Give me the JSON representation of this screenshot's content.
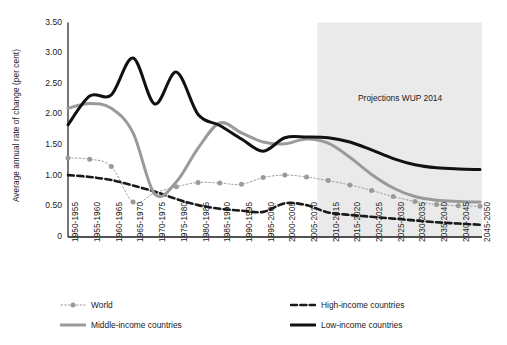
{
  "chart_data": {
    "type": "line",
    "title": "",
    "subtitle": "",
    "xlabel": "",
    "ylabel": "Average annual rate of change (per cent)",
    "ylim": [
      0,
      3.5
    ],
    "ytick_labels": [
      "3.50",
      "3.00",
      "2.50",
      "2.00",
      "1.50",
      "1.00",
      "0.50",
      "0"
    ],
    "ytick_values": [
      3.5,
      3.0,
      2.5,
      2.0,
      1.5,
      1.0,
      0.5,
      0
    ],
    "grid": false,
    "legend_position": "bottom",
    "categories": [
      "1950-1955",
      "1955-1960",
      "1960-1965",
      "1965-1970",
      "1970-1975",
      "1975-1980",
      "1980-1985",
      "1985-1990",
      "1990-1995",
      "1995-2000",
      "2000-2005",
      "2005-2010",
      "2010-2015",
      "2015-2020",
      "2020-2025",
      "2025-2030",
      "2030-2035",
      "2035-2040",
      "2040-2045",
      "2045-2050"
    ],
    "annotations": [
      {
        "text": "Projections WUP 2014",
        "type": "shaded-region-label",
        "region_start_category": "2010-2015",
        "region_end_category": "2045-2050",
        "region_color": "#eaeaea"
      }
    ],
    "series": [
      {
        "name": "World",
        "color": "#9a9a9a",
        "style": "dotted-with-markers",
        "marker": "circle",
        "values": [
          1.29,
          1.27,
          1.15,
          0.57,
          0.72,
          0.82,
          0.89,
          0.88,
          0.86,
          0.97,
          1.01,
          0.98,
          0.92,
          0.85,
          0.76,
          0.66,
          0.58,
          0.53,
          0.51,
          0.5
        ]
      },
      {
        "name": "High-income countries",
        "color": "#1a1a1a",
        "style": "dashed",
        "marker": "none",
        "values": [
          1.01,
          0.98,
          0.93,
          0.84,
          0.74,
          0.62,
          0.52,
          0.46,
          0.43,
          0.41,
          0.55,
          0.52,
          0.4,
          0.36,
          0.33,
          0.3,
          0.27,
          0.24,
          0.22,
          0.2
        ]
      },
      {
        "name": "Middle-income countries",
        "color": "#9a9a9a",
        "style": "solid-thick",
        "marker": "none",
        "values": [
          2.1,
          2.18,
          2.1,
          1.7,
          0.7,
          0.9,
          1.45,
          1.86,
          1.7,
          1.55,
          1.52,
          1.6,
          1.53,
          1.3,
          1.02,
          0.8,
          0.66,
          0.6,
          0.58,
          0.57
        ]
      },
      {
        "name": "Low-income countries",
        "color": "#111111",
        "style": "solid-thick",
        "marker": "none",
        "values": [
          1.83,
          2.3,
          2.32,
          2.92,
          2.17,
          2.69,
          2.0,
          1.82,
          1.6,
          1.4,
          1.62,
          1.63,
          1.62,
          1.55,
          1.42,
          1.28,
          1.18,
          1.13,
          1.11,
          1.1
        ]
      }
    ]
  },
  "legend": {
    "items": [
      {
        "label": "World",
        "key": "world"
      },
      {
        "label": "High-income countries",
        "key": "high-income"
      },
      {
        "label": "Middle-income countries",
        "key": "middle-income"
      },
      {
        "label": "Low-income countries",
        "key": "low-income"
      }
    ]
  }
}
